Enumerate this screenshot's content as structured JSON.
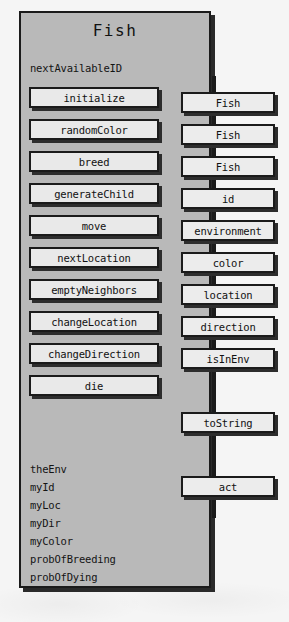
{
  "diagram": {
    "type": "uml-class-diagram",
    "class_name": "Fish",
    "static_field": "nextAvailableID",
    "methods": [
      {
        "label": "initialize"
      },
      {
        "label": "randomColor"
      },
      {
        "label": "breed"
      },
      {
        "label": "generateChild"
      },
      {
        "label": "move"
      },
      {
        "label": "nextLocation"
      },
      {
        "label": "emptyNeighbors"
      },
      {
        "label": "changeLocation"
      },
      {
        "label": "changeDirection"
      },
      {
        "label": "die"
      }
    ],
    "instance_variables": [
      {
        "label": "theEnv"
      },
      {
        "label": "myId"
      },
      {
        "label": "myLoc"
      },
      {
        "label": "myDir"
      },
      {
        "label": "myColor"
      },
      {
        "label": "probOfBreeding"
      },
      {
        "label": "probOfDying"
      }
    ],
    "signatures": [
      {
        "label": "Fish"
      },
      {
        "label": "Fish"
      },
      {
        "label": "Fish"
      },
      {
        "label": "id"
      },
      {
        "label": "environment"
      },
      {
        "label": "color"
      },
      {
        "label": "location"
      },
      {
        "label": "direction"
      },
      {
        "label": "isInEnv"
      },
      {
        "label": "toString"
      },
      {
        "label": "act"
      }
    ],
    "colors": {
      "page_background": "#f5f5f5",
      "class_box_fill": "#b9b9b9",
      "method_box_fill": "#e9e9e9",
      "signature_box_fill": "#ececec",
      "outline": "#1b1b1b",
      "shadow": "#2d2d2d"
    }
  }
}
